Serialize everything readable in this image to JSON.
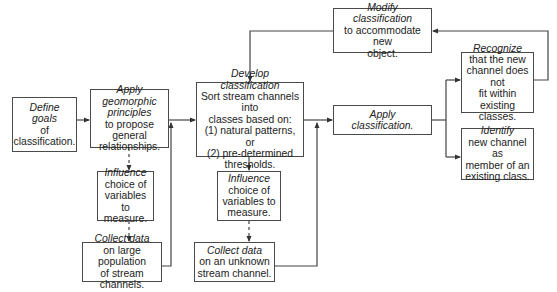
{
  "diagram": {
    "type": "flowchart",
    "nodes": {
      "define_goals": {
        "title": "Define\ngoals",
        "body": "of\nclassification."
      },
      "apply_principles": {
        "title": "Apply\ngeomorphic\nprinciples",
        "body": "to propose general\nrelationships."
      },
      "influence_1": {
        "title": "Influence",
        "body": "choice of\nvariables to\nmeasure."
      },
      "collect_1": {
        "title": "Collect data",
        "body": "on large population\nof stream channels."
      },
      "develop": {
        "title": "Develop\nclassification",
        "body": "Sort stream channels into\nclasses based on:\n(1) natural patterns, or\n(2) pre-determined\nthresholds."
      },
      "influence_2": {
        "title": "Influence",
        "body": "choice of\nvariables to\nmeasure."
      },
      "collect_2": {
        "title": "Collect data",
        "body": "on an unknown\nstream channel."
      },
      "modify": {
        "title": "Modify\nclassification",
        "body": "to accommodate new\nobject."
      },
      "apply_classification": {
        "title": "Apply\nclassification.",
        "body": ""
      },
      "recognize": {
        "title": "Recognize",
        "body": "that the new\nchannel does not\nfit within\nexisting classes."
      },
      "identify": {
        "title": "Identify",
        "body": "new channel as\nmember of an\nexisting class."
      }
    },
    "edges": [
      {
        "from": "define_goals",
        "to": "apply_principles",
        "style": "solid"
      },
      {
        "from": "apply_principles",
        "to": "influence_1",
        "style": "dashed"
      },
      {
        "from": "influence_1",
        "to": "collect_1",
        "style": "dashed"
      },
      {
        "from": "collect_1",
        "to": "develop",
        "style": "solid"
      },
      {
        "from": "apply_principles",
        "to": "develop",
        "style": "solid"
      },
      {
        "from": "develop",
        "to": "influence_2",
        "style": "dashed"
      },
      {
        "from": "influence_2",
        "to": "collect_2",
        "style": "dashed"
      },
      {
        "from": "collect_2",
        "to": "apply_classification",
        "style": "solid"
      },
      {
        "from": "develop",
        "to": "apply_classification",
        "style": "solid"
      },
      {
        "from": "apply_classification",
        "to": "recognize",
        "style": "solid"
      },
      {
        "from": "apply_classification",
        "to": "identify",
        "style": "solid"
      },
      {
        "from": "recognize",
        "to": "modify",
        "style": "solid"
      },
      {
        "from": "modify",
        "to": "develop",
        "style": "solid"
      }
    ]
  }
}
